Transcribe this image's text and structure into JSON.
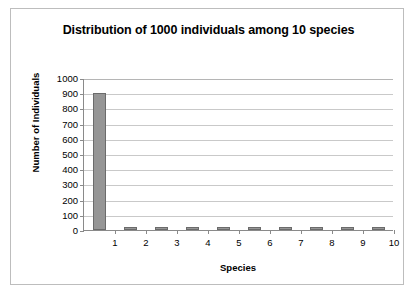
{
  "chart_data": {
    "type": "bar",
    "title": "Distribution of 1000 individuals among 10 species",
    "xlabel": "Species",
    "ylabel": "Number of Individuals",
    "categories": [
      "1",
      "2",
      "3",
      "4",
      "5",
      "6",
      "7",
      "8",
      "9",
      "10"
    ],
    "values": [
      900,
      20,
      15,
      15,
      20,
      15,
      15,
      15,
      15,
      15
    ],
    "ylim": [
      0,
      1000
    ],
    "ytick_labels": [
      "0",
      "100",
      "200",
      "300",
      "400",
      "500",
      "600",
      "700",
      "800",
      "900",
      "1000"
    ],
    "ytick_values": [
      0,
      100,
      200,
      300,
      400,
      500,
      600,
      700,
      800,
      900,
      1000
    ],
    "grid": "horizontal",
    "legend": "none",
    "bar_color": "#969696",
    "bar_border_color": "#6b6b6b",
    "gridline_color": "#c9c9c9",
    "axis_color": "#8a8a8a",
    "frame_color": "#bdbdbd",
    "background": "#ffffff"
  }
}
